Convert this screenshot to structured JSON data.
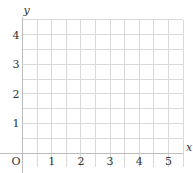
{
  "chart_data": {
    "type": "scatter",
    "title": "",
    "xlabel": "x",
    "ylabel": "y",
    "origin_label": "O",
    "x_ticks": [
      "1",
      "2",
      "3",
      "4",
      "5"
    ],
    "y_ticks": [
      "1",
      "2",
      "3",
      "4"
    ],
    "xlim": [
      0,
      5.5
    ],
    "ylim": [
      0,
      4.5
    ],
    "grid": true,
    "grid_minor_step": 0.5,
    "series": [],
    "legend": null
  },
  "colors": {
    "grid": "#d9d9d9",
    "axis": "#bdbdbd",
    "text": "#333333",
    "background": "#ffffff"
  }
}
